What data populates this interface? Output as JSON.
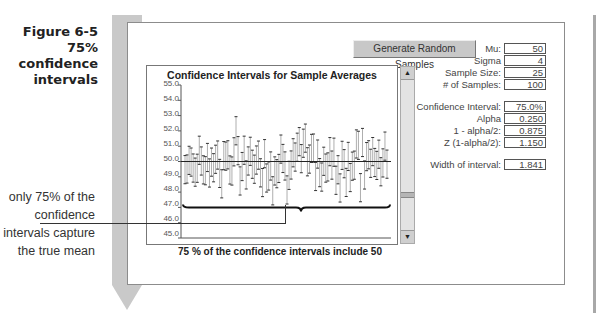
{
  "figure": {
    "caption_lines": [
      "Figure 6-5",
      "75%",
      "confidence",
      "intervals"
    ],
    "note_lines": [
      "only 75% of the",
      "confidence",
      "intervals capture",
      "the true mean"
    ]
  },
  "toolbar": {
    "generate_label": "Generate Random Samples"
  },
  "chart": {
    "title": "Confidence Intervals for Sample Averages",
    "footer": "75 % of the confidence intervals include 50",
    "yticks": [
      "55.0",
      "54.0",
      "53.0",
      "52.0",
      "51.0",
      "50.0",
      "49.0",
      "48.0",
      "47.0",
      "46.0",
      "45.0"
    ]
  },
  "scrollbar": {
    "up": "▲",
    "down": "▼"
  },
  "params": {
    "mu": {
      "label": "Mu:",
      "value": "50"
    },
    "sigma": {
      "label": "Sigma",
      "value": "4"
    },
    "sample_size": {
      "label": "Sample Size:",
      "value": "25"
    },
    "num_samples": {
      "label": "# of Samples:",
      "value": "100"
    },
    "confidence": {
      "label": "Confidence Interval:",
      "value": "75.0%"
    },
    "alpha": {
      "label": "Alpha",
      "value": "0.250"
    },
    "one_minus_half_alpha": {
      "label": "1 - alpha/2:",
      "value": "0.875"
    },
    "z": {
      "label": "Z (1-alpha/2):",
      "value": "1.150"
    },
    "width": {
      "label": "Width of interval:",
      "value": "1.841"
    }
  },
  "chart_data": {
    "type": "scatter",
    "title": "Confidence Intervals for Sample Averages",
    "xlabel": "",
    "ylabel": "",
    "ylim": [
      45.0,
      55.0
    ],
    "yticks": [
      45,
      46,
      47,
      48,
      49,
      50,
      51,
      52,
      53,
      54,
      55
    ],
    "reference_line": 50.0,
    "n_intervals": 100,
    "interval_width": 1.841,
    "annotation": "75 % of the confidence intervals include 50",
    "grid": false
  }
}
